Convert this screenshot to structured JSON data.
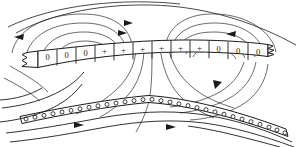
{
  "figure": {
    "background_color": "#ffffff",
    "ink_color": "#1b1b1b",
    "width": 298,
    "height": 147
  },
  "upper_band": {
    "name": "upper-charge-sheet",
    "description": "Arched segmented strip with torn left and right ends",
    "left_torn_edge": true,
    "right_torn_edge": true,
    "cell_count": 12,
    "cells": [
      {
        "index": 0,
        "label": "0"
      },
      {
        "index": 1,
        "label": "0"
      },
      {
        "index": 2,
        "label": "0"
      },
      {
        "index": 3,
        "label": "+"
      },
      {
        "index": 4,
        "label": "+"
      },
      {
        "index": 5,
        "label": "+"
      },
      {
        "index": 6,
        "label": "+"
      },
      {
        "index": 7,
        "label": "+"
      },
      {
        "index": 8,
        "label": "+"
      },
      {
        "index": 9,
        "label": "0"
      },
      {
        "index": 10,
        "label": "0"
      },
      {
        "index": 11,
        "label": "0"
      }
    ]
  },
  "lower_band": {
    "name": "lower-circle-sheet",
    "description": "Chevron-shaped strip filled with small open circles",
    "circle_label": "o",
    "circle_count": 30,
    "apex_x": 150
  },
  "annotations": {
    "arrow_top_left": "left",
    "arrow_top_right": "left",
    "arrow_loop_upper": "right",
    "arrow_loop_lower": "right",
    "arrow_mid_right": "down-left",
    "arrow_flow_lower_left": "right",
    "arrow_flow_lower_right": "right"
  }
}
